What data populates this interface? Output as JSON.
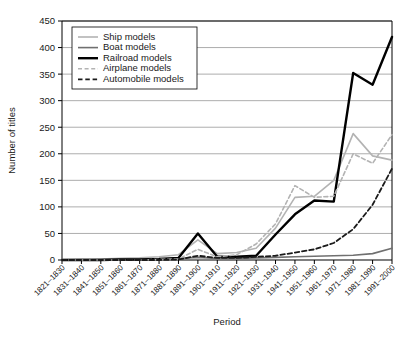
{
  "chart_data": {
    "type": "line",
    "title": "",
    "xlabel": "Period",
    "ylabel": "Number of titles",
    "ylim": [
      0,
      450
    ],
    "ytick_step": 50,
    "yticks": [
      0,
      50,
      100,
      150,
      200,
      250,
      300,
      350,
      400,
      450
    ],
    "grid": "horizontal",
    "legend_position": "top-left",
    "categories": [
      "1821–1830",
      "1831–1840",
      "1841–1850",
      "1851–1860",
      "1861–1870",
      "1871–1880",
      "1881–1890",
      "1891–1900",
      "1901–1910",
      "1911–1920",
      "1921–1930",
      "1931–1940",
      "1941–1950",
      "1951–1960",
      "1961–1970",
      "1971–1980",
      "1981–1990",
      "1991–2000"
    ],
    "series": [
      {
        "name": "Ship models",
        "color": "#b3b3b3",
        "style": "solid",
        "width": 1.6,
        "values": [
          1,
          2,
          2,
          3,
          4,
          6,
          10,
          38,
          12,
          14,
          22,
          60,
          118,
          120,
          150,
          238,
          196,
          188
        ]
      },
      {
        "name": "Boat models",
        "color": "#707070",
        "style": "solid",
        "width": 1.6,
        "values": [
          0,
          0,
          1,
          1,
          1,
          2,
          3,
          5,
          3,
          3,
          4,
          5,
          6,
          7,
          8,
          9,
          12,
          22
        ]
      },
      {
        "name": "Railroad models",
        "color": "#000000",
        "style": "solid",
        "width": 2.4,
        "values": [
          0,
          0,
          0,
          1,
          1,
          2,
          4,
          50,
          6,
          6,
          8,
          48,
          86,
          112,
          110,
          352,
          330,
          420
        ]
      },
      {
        "name": "Airplane models",
        "color": "#b3b3b3",
        "style": "dashed",
        "width": 1.6,
        "values": [
          0,
          0,
          0,
          0,
          0,
          1,
          2,
          20,
          6,
          10,
          30,
          68,
          140,
          118,
          120,
          200,
          182,
          236
        ]
      },
      {
        "name": "Automobile models",
        "color": "#1a1a1a",
        "style": "dashed",
        "width": 1.8,
        "values": [
          0,
          0,
          0,
          0,
          0,
          0,
          1,
          8,
          4,
          4,
          6,
          8,
          14,
          20,
          32,
          58,
          104,
          172
        ]
      }
    ]
  },
  "legend": {
    "entries": [
      {
        "label": "Ship models"
      },
      {
        "label": "Boat models"
      },
      {
        "label": "Railroad models"
      },
      {
        "label": "Airplane models"
      },
      {
        "label": "Automobile models"
      }
    ]
  }
}
